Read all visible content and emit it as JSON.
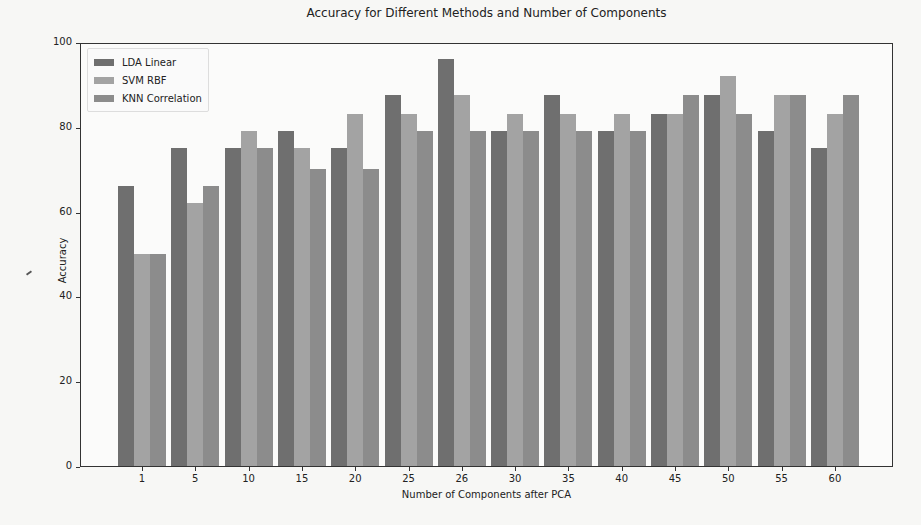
{
  "chart_data": {
    "type": "bar",
    "title": "Accuracy for Different Methods and Number of Components",
    "xlabel": "Number of Components after PCA",
    "ylabel": "Accuracy",
    "ylim": [
      0,
      100
    ],
    "yticks": [
      0,
      20,
      40,
      60,
      80,
      100
    ],
    "grid": false,
    "legend_position": "upper left",
    "categories": [
      "1",
      "5",
      "10",
      "15",
      "20",
      "25",
      "26",
      "30",
      "35",
      "40",
      "45",
      "50",
      "55",
      "60"
    ],
    "series": [
      {
        "name": "LDA Linear",
        "color": "#6f6f6f",
        "values": [
          66,
          75,
          75,
          79,
          75,
          87.5,
          96,
          79,
          87.5,
          79,
          83,
          87.5,
          79,
          75
        ]
      },
      {
        "name": "SVM RBF",
        "color": "#a3a3a3",
        "values": [
          50,
          62,
          79,
          75,
          83,
          83,
          87.5,
          83,
          83,
          83,
          83,
          92,
          87.5,
          83
        ]
      },
      {
        "name": "KNN Correlation",
        "color": "#8c8c8c",
        "values": [
          50,
          66,
          75,
          70,
          70,
          79,
          79,
          79,
          79,
          79,
          87.5,
          83,
          87.5,
          87.5
        ]
      }
    ]
  }
}
